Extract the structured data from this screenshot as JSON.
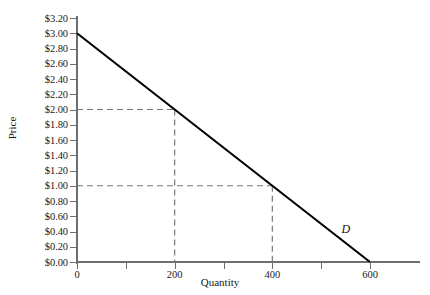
{
  "chart_data": {
    "type": "line",
    "title": "",
    "xlabel": "Quantity",
    "ylabel": "Price",
    "xlim": [
      0,
      705
    ],
    "ylim": [
      0,
      3.2
    ],
    "grid": false,
    "legend": "inline-curve-label",
    "x_ticks": [
      0,
      100,
      200,
      300,
      400,
      500,
      600
    ],
    "x_tick_labels": [
      "0",
      "",
      "200",
      "",
      "400",
      "",
      "600"
    ],
    "y_ticks": [
      0.0,
      0.2,
      0.4,
      0.6,
      0.8,
      1.0,
      1.2,
      1.4,
      1.6,
      1.8,
      2.0,
      2.2,
      2.4,
      2.6,
      2.8,
      3.0,
      3.2
    ],
    "y_tick_labels": [
      "$0.00",
      "$0.20",
      "$0.40",
      "$0.60",
      "$0.80",
      "$1.00",
      "$1.20",
      "$1.40",
      "$1.60",
      "$1.80",
      "$2.00",
      "$2.20",
      "$2.40",
      "$2.60",
      "$2.80",
      "$3.00",
      "$3.20"
    ],
    "series": [
      {
        "name": "D",
        "label": "D",
        "type": "line",
        "color": "#000000",
        "x": [
          0,
          600
        ],
        "values": [
          3.0,
          0.0
        ],
        "label_position": {
          "x": 550,
          "y": 0.42
        }
      }
    ],
    "annotations": [
      {
        "kind": "dashed-guide",
        "label": "",
        "quantity": 200,
        "price": 2.0
      },
      {
        "kind": "dashed-guide",
        "label": "",
        "quantity": 400,
        "price": 1.0
      }
    ],
    "colors": {
      "curve": "#000000",
      "axis": "#6e6e6e",
      "guide": "#777777",
      "text": "#1a1a1a",
      "background": "#ffffff"
    }
  }
}
